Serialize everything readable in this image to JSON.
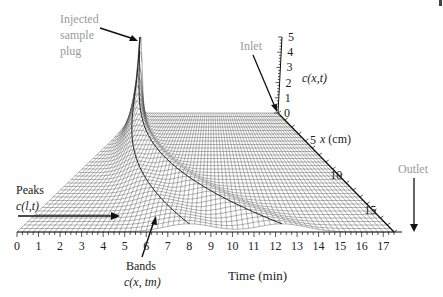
{
  "chart_data": {
    "type": "surface",
    "title": "",
    "time_axis": {
      "label": "Time (min)",
      "range": [
        0,
        17.5
      ],
      "ticks": [
        "0",
        "1",
        "2",
        "3",
        "4",
        "5",
        "6",
        "7",
        "8",
        "9",
        "10",
        "11",
        "12",
        "13",
        "14",
        "15",
        "16",
        "17"
      ]
    },
    "x_axis": {
      "label": "x (cm)",
      "range": [
        0,
        17
      ],
      "ticks": [
        "5",
        "10",
        "15"
      ]
    },
    "c_axis": {
      "label": "c(x,t)",
      "range": [
        0,
        5
      ],
      "ticks": [
        "0",
        "1",
        "2",
        "3",
        "4",
        "5"
      ]
    },
    "bands": [
      {
        "name": "band-1",
        "elution_time_at_outlet_min": 8.0,
        "relative_speed": "fast"
      },
      {
        "name": "band-2",
        "elution_time_at_outlet_min": 12.3,
        "relative_speed": "slow"
      }
    ],
    "injection_peak": {
      "x_cm": 0,
      "t_min": 0,
      "c_max": 5
    },
    "annotations": {
      "injected": [
        "Injected",
        "sample",
        "plug"
      ],
      "inlet": "Inlet",
      "outlet": "Outlet",
      "peaks": [
        "Peaks",
        "c(l,t)"
      ],
      "bands": [
        "Bands",
        "c(x, tm)"
      ]
    },
    "grid": true
  }
}
